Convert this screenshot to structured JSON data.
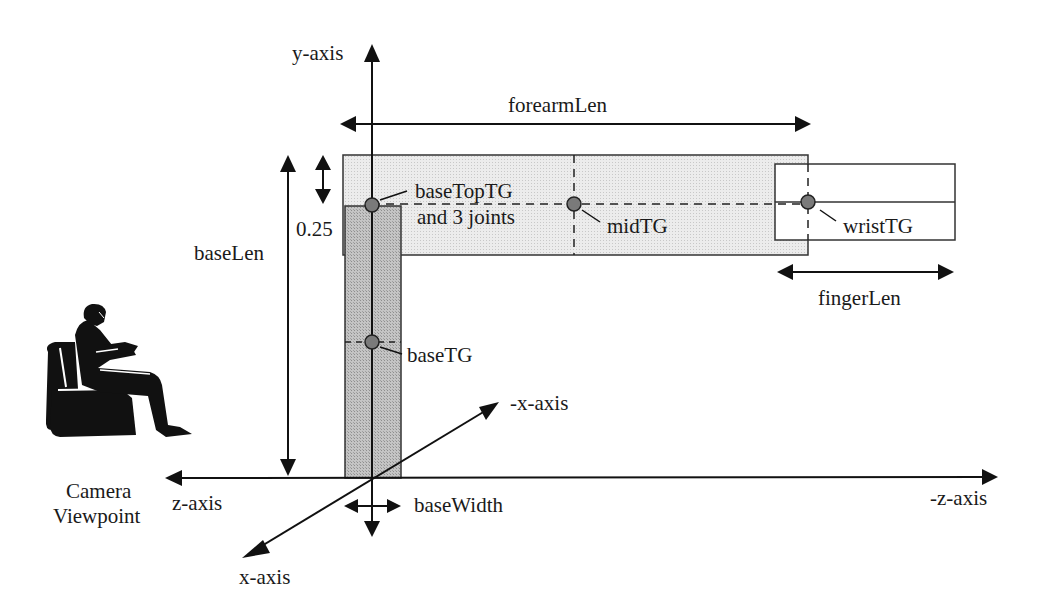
{
  "diagram": {
    "colors": {
      "ink": "#111111",
      "base_fill": "#bdbdbd",
      "forearm_fill": "#ececec",
      "finger_fill": "#ffffff",
      "node_fill": "#7a7a7a"
    },
    "axes": {
      "y": "y-axis",
      "z": "z-axis",
      "neg_z": "-z-axis",
      "x": "x-axis",
      "neg_x": "-x-axis"
    },
    "dimensions": {
      "forearm": "forearmLen",
      "base_len": "baseLen",
      "offset": "0.25",
      "finger": "fingerLen",
      "base_width": "baseWidth"
    },
    "nodes": {
      "base_top": [
        "baseTopTG",
        "and 3 joints"
      ],
      "mid": "midTG",
      "wrist": "wristTG",
      "base": "baseTG"
    },
    "camera": [
      "Camera",
      "Viewpoint"
    ],
    "camera_icon": "person-in-armchair-icon"
  }
}
